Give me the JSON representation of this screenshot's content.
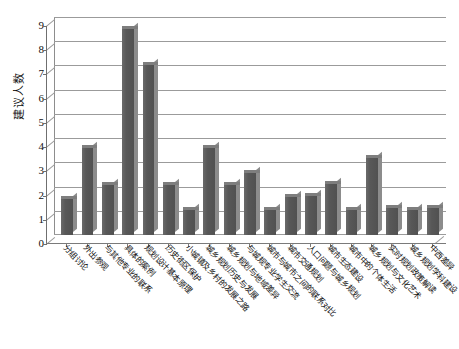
{
  "chart_data": {
    "type": "bar",
    "title": "",
    "xlabel": "",
    "ylabel": "建议人数",
    "ylim": [
      0,
      9
    ],
    "yticks": [
      0,
      1,
      2,
      3,
      4,
      5,
      6,
      7,
      8,
      9
    ],
    "grid": true,
    "legend": "none",
    "bar_color": "#5a5a5a",
    "categories": [
      "分组讨论",
      "外出参观",
      "与其他专业的联系",
      "具体的案例",
      "规划设计基本原理",
      "历史街区保护",
      "小城镇及乡村的发展之路",
      "城乡规划历史与发展",
      "城乡规划与地域差异",
      "与城规专业学生交流",
      "城市与城市之间的联系对比",
      "城市交通规划",
      "人口问题与城乡规划",
      "城市生态建设",
      "城市中的个体生活",
      "城乡规划与文化艺术",
      "实时规划政策解读",
      "城乡规划学科建设",
      "中西差异"
    ],
    "values": [
      1.5,
      3.6,
      2.05,
      8.5,
      7.0,
      2.05,
      1.05,
      3.6,
      2.05,
      2.55,
      1.05,
      1.55,
      1.6,
      2.1,
      1.05,
      3.2,
      1.1,
      1.05,
      1.1
    ]
  }
}
